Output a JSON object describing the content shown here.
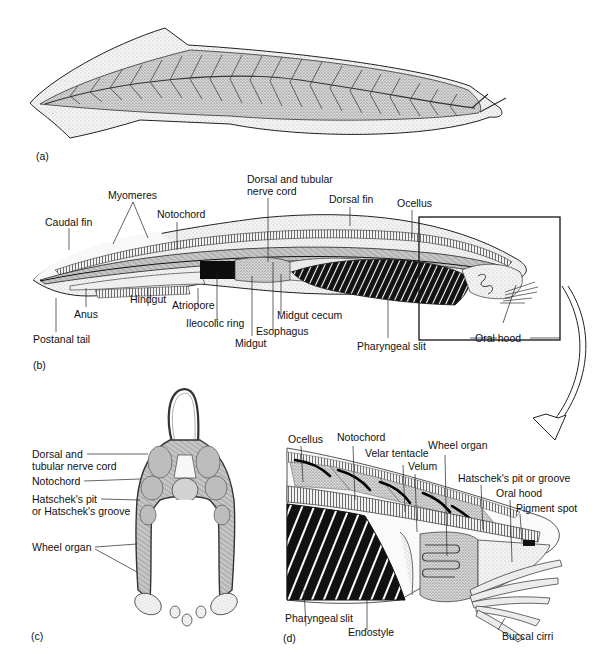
{
  "figure": {
    "panels": {
      "a": {
        "tag": "(a)",
        "description": "External view of lancelet showing chevron-shaped myomeres"
      },
      "b": {
        "tag": "(b)",
        "labels": {
          "caudal_fin": "Caudal fin",
          "myomeres": "Myomeres",
          "notochord": "Notochord",
          "dorsal_nerve_cord_l1": "Dorsal and tubular",
          "dorsal_nerve_cord_l2": "nerve cord",
          "dorsal_fin": "Dorsal fin",
          "ocellus": "Ocellus",
          "anus": "Anus",
          "postanal_tail": "Postanal tail",
          "hindgut": "Hindgut",
          "atriopore": "Atriopore",
          "ileocolic_ring": "Ileocolic ring",
          "midgut": "Midgut",
          "esophagus": "Esophagus",
          "midgut_cecum": "Midgut cecum",
          "pharyngeal_slit": "Pharyngeal slit",
          "oral_hood": "Oral hood"
        }
      },
      "c": {
        "tag": "(c)",
        "labels": {
          "dorsal_nerve_cord_l1": "Dorsal and",
          "dorsal_nerve_cord_l2": "tubular nerve cord",
          "notochord": "Notochord",
          "hatschek_l1": "Hatschek's pit",
          "hatschek_l2": "or Hatschek's groove",
          "wheel_organ": "Wheel organ"
        }
      },
      "d": {
        "tag": "(d)",
        "labels": {
          "ocellus": "Ocellus",
          "notochord": "Notochord",
          "velar_tentacle": "Velar tentacle",
          "velum": "Velum",
          "wheel_organ": "Wheel organ",
          "hatschek": "Hatschek's pit or groove",
          "oral_hood": "Oral hood",
          "pigment_spot": "Pigment spot",
          "pharyngeal": "Pharyngeal",
          "slit": "slit",
          "endostyle": "Endostyle",
          "buccal_cirri": "Buccal cirri"
        }
      }
    },
    "colors": {
      "ink": "#111111",
      "stipple": "#9a9a9a",
      "fill_light": "#e6e6e6",
      "fill_mid": "#bdbdbd",
      "fill_dark": "#141414"
    }
  }
}
